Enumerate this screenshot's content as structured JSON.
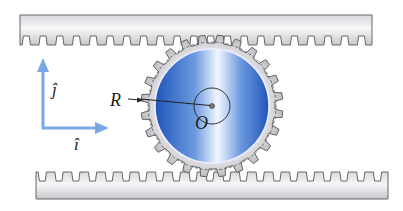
{
  "diagram": {
    "labels": {
      "radius": "R",
      "center": "O",
      "unit_j": "ĵ",
      "unit_i": "î"
    },
    "gear": {
      "tooth_count": 24
    },
    "racks": {
      "top_tooth_count": 21,
      "bottom_tooth_count": 21
    },
    "colors": {
      "axis_arrow": "#7aa7e6",
      "rack_fill": "#e6e6ea",
      "rack_stroke": "#666666",
      "gear_ring": "#c9c9cc",
      "gear_blue_dark": "#2b63c5",
      "gear_blue_light": "#e8f1ff",
      "line": "#222222"
    }
  }
}
